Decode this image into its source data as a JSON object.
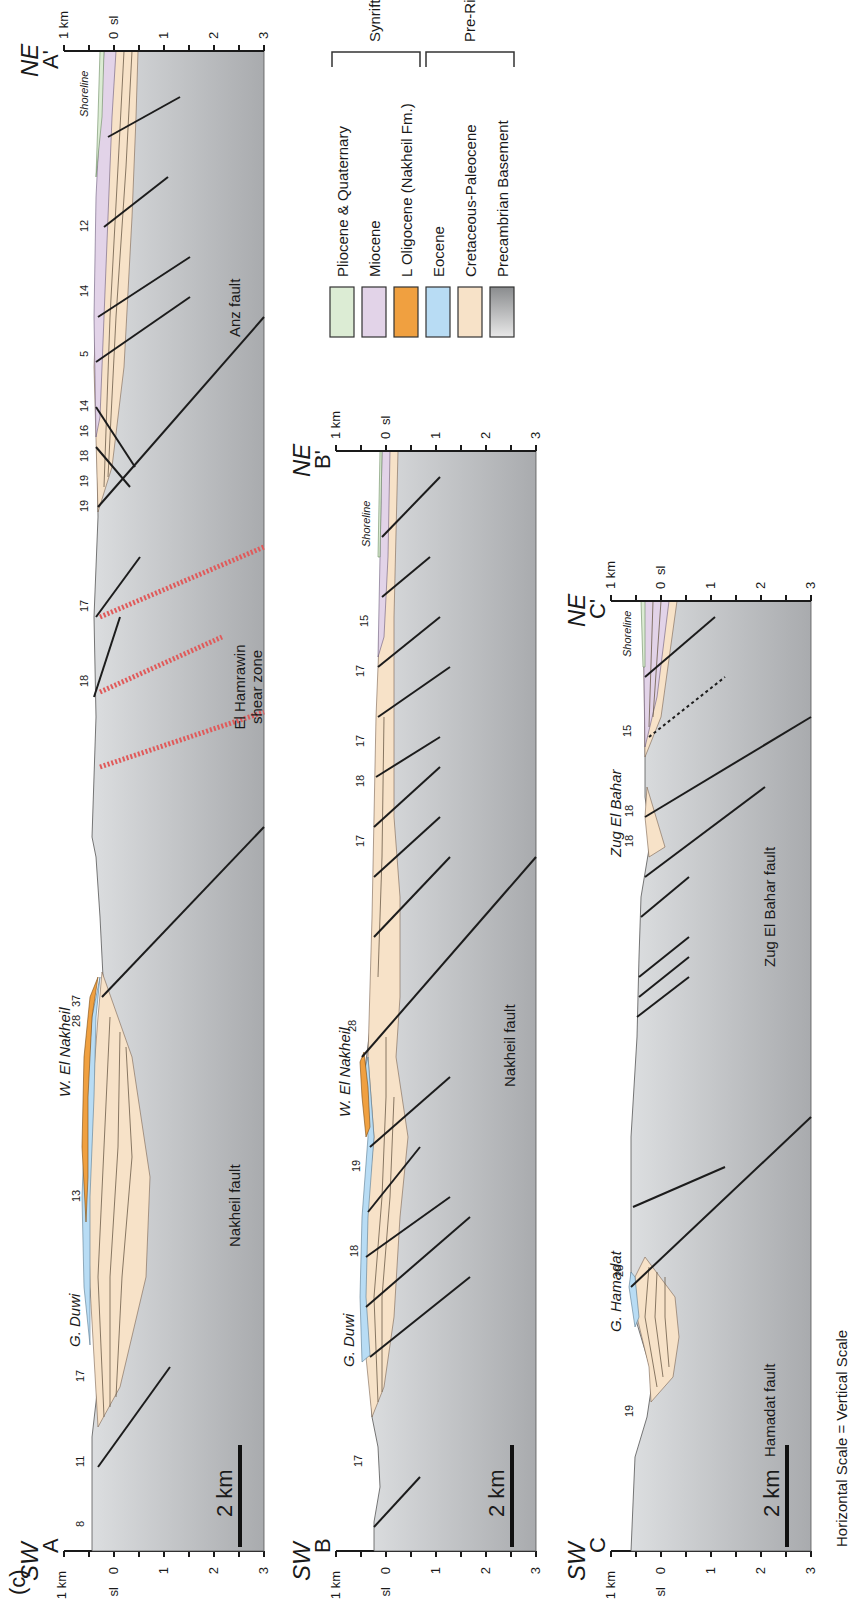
{
  "figure": {
    "panel_label": "(c)",
    "scale_note": "Horizontal Scale = Vertical Scale",
    "scale_bar_label": "2 km"
  },
  "axis": {
    "top_label": "1 km",
    "sl_label": "sl",
    "ticks": [
      "0",
      "1",
      "2",
      "3"
    ]
  },
  "legend": {
    "items": [
      {
        "label": "Pliocene & Quaternary",
        "color": "#dcecd4"
      },
      {
        "label": "Miocene",
        "color": "#e2d3e8"
      },
      {
        "label": "L Oligocene  (Nakheil Fm.)",
        "color": "#f0a040"
      },
      {
        "label": "Eocene",
        "color": "#b8dcf4"
      },
      {
        "label": "Cretaceous-Paleocene",
        "color": "#f7e2c8"
      },
      {
        "label": "Precambrian Basement",
        "color": "#c8cacc"
      }
    ],
    "groups": [
      {
        "label": "Synrift"
      },
      {
        "label": "Pre-Rift"
      }
    ]
  },
  "sections": [
    {
      "id": "A",
      "start_label": "A",
      "end_label": "A'",
      "start_dir": "SW",
      "end_dir": "NE",
      "place_names": [
        "G. Duwi",
        "W. El Nakheil"
      ],
      "fault_names": [
        "Nakheil fault",
        "Anz fault"
      ],
      "zone_label_1": "El Hamrawin",
      "zone_label_2": "shear zone",
      "shoreline": "Shoreline",
      "dips": [
        "8",
        "11",
        "17",
        "13",
        "28",
        "37",
        "18",
        "17",
        "19",
        "19",
        "18",
        "16",
        "14",
        "5",
        "14",
        "12"
      ]
    },
    {
      "id": "B",
      "start_label": "B",
      "end_label": "B'",
      "start_dir": "SW",
      "end_dir": "NE",
      "place_names": [
        "G. Duwi",
        "W. El Nakheil"
      ],
      "fault_names": [
        "Nakheil fault"
      ],
      "shoreline": "Shoreline",
      "dips": [
        "17",
        "18",
        "19",
        "28",
        "17",
        "18",
        "17",
        "17",
        "15"
      ]
    },
    {
      "id": "C",
      "start_label": "C",
      "end_label": "C'",
      "start_dir": "SW",
      "end_dir": "NE",
      "place_names": [
        "G. Hamadat",
        "Zug El Bahar"
      ],
      "fault_names": [
        "Hamadat fault",
        "Zug El Bahar fault"
      ],
      "shoreline": "Shoreline",
      "dips": [
        "19",
        "28",
        "18",
        "18",
        "15"
      ]
    }
  ]
}
